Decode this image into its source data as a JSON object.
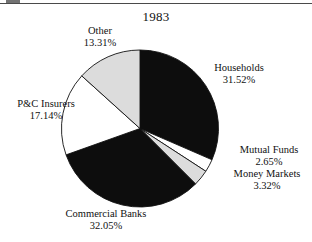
{
  "figure": {
    "title": "1983",
    "has_top_rule": true
  },
  "chart_data": {
    "type": "pie",
    "title": "1983",
    "xlabel": "",
    "ylabel": "",
    "legend_position": "none",
    "labels_inline": true,
    "start_angle_deg": 0,
    "direction": "clockwise",
    "categories": [
      "Households",
      "Mutual Funds",
      "Money Markets",
      "Commercial Banks",
      "P&C Insurers",
      "Other"
    ],
    "values": [
      31.52,
      2.65,
      3.32,
      32.05,
      17.14,
      13.31
    ],
    "value_suffix": "%",
    "slice_colors": [
      "#0d0d0d",
      "#ffffff",
      "#dcdcdc",
      "#0d0d0d",
      "#ffffff",
      "#dcdcdc"
    ],
    "slice_outline": "#111111",
    "total": 99.99
  },
  "labels": {
    "other": {
      "name": "Other",
      "value": "13.31%"
    },
    "households": {
      "name": "Households",
      "value": "31.52%"
    },
    "mutual_funds": {
      "name": "Mutual Funds",
      "value": "2.65%"
    },
    "money_markets": {
      "name": "Money Markets",
      "value": "3.32%"
    },
    "commercial_banks": {
      "name": "Commercial Banks",
      "value": "32.05%"
    },
    "pc_insurers": {
      "name": "P&C Insurers",
      "value": "17.14%"
    }
  },
  "colors": {
    "black_slice": "#0d0d0d",
    "gray_slice": "#dcdcdc",
    "white_slice": "#ffffff",
    "outline": "#111111",
    "text": "#111111",
    "rule": "#4a4a4a",
    "background": "#ffffff"
  }
}
